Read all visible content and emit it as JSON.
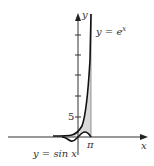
{
  "figure": {
    "axes": {
      "x_label": "x",
      "y_label": "y"
    },
    "curves": [
      {
        "name": "exp",
        "label": "y = e",
        "superscript": "x"
      },
      {
        "name": "sin",
        "label": "y = sin x"
      }
    ],
    "ticks": {
      "y_tick_label": "5",
      "x_tick_label": "π"
    },
    "shaded_region": "area between y = e^x and y = sin x up to x = π",
    "colors": {
      "curve": "#111111",
      "axis": "#333333",
      "shade": "#d9d9d9"
    }
  }
}
